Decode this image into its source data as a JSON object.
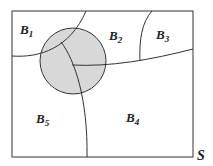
{
  "diagram": {
    "type": "venn-partition",
    "sample_space_label": "S",
    "partitions": [
      {
        "name": "B",
        "sub": "1"
      },
      {
        "name": "B",
        "sub": "2"
      },
      {
        "name": "B",
        "sub": "3"
      },
      {
        "name": "B",
        "sub": "4"
      },
      {
        "name": "B",
        "sub": "5"
      }
    ],
    "event_fill": "#d8d8d8",
    "line_color": "#333333"
  }
}
